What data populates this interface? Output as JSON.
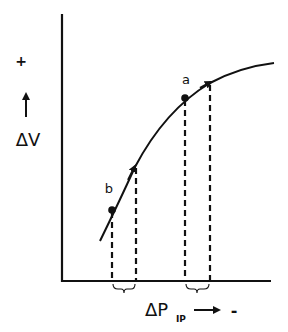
{
  "diagram": {
    "y_axis": {
      "plus_sign": "+",
      "label": "ΔV"
    },
    "x_axis": {
      "label_main": "ΔP",
      "label_sub": "IP",
      "minus_sign": "-"
    },
    "points": [
      {
        "id": "a",
        "label": "a"
      },
      {
        "id": "b",
        "label": "b"
      }
    ],
    "colors": {
      "ink": "#111111",
      "background": "#ffffff"
    }
  }
}
